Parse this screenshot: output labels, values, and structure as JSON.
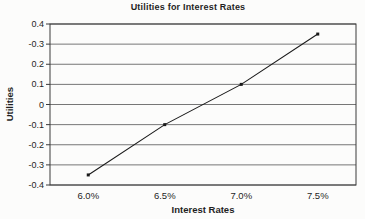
{
  "chart": {
    "title": "Utilities for Interest Rates",
    "xlabel": "Interest Rates",
    "ylabel": "Utilities"
  },
  "chart_data": {
    "type": "line",
    "title": "Utilities for Interest Rates",
    "xlabel": "Interest Rates",
    "ylabel": "Utilities",
    "categories": [
      "6.0%",
      "6.5%",
      "7.0%",
      "7.5%"
    ],
    "series": [
      {
        "name": "Utility",
        "values": [
          -0.35,
          -0.1,
          0.1,
          0.35
        ]
      }
    ],
    "ylim": [
      -0.4,
      0.4
    ],
    "yticks": [
      0.4,
      0.3,
      0.2,
      0.1,
      0,
      -0.1,
      -0.2,
      -0.3,
      -0.4
    ],
    "ytick_labels": [
      "0.4",
      "-0.3",
      "0.2",
      "0.1",
      "0",
      "-0.1",
      "-0.2",
      "-0.3",
      "-0.4"
    ],
    "grid": "horizontal-on",
    "legend": "none",
    "marker": "small-square",
    "colors": {
      "line": "#1a1a1a",
      "grid": "#767676",
      "axis": "#3a3a3a",
      "text": "#1f1f1f",
      "background": "#fcfcfb"
    }
  }
}
